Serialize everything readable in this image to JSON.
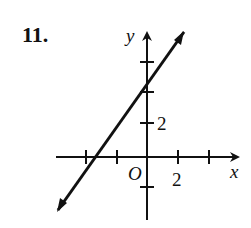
{
  "problem_number": "11.",
  "axes": {
    "x_label": "x",
    "y_label": "y",
    "origin_label": "O",
    "x_tick_label": "2",
    "y_tick_label": "2"
  },
  "colors": {
    "ink": "#111111",
    "background": "#ffffff"
  }
}
